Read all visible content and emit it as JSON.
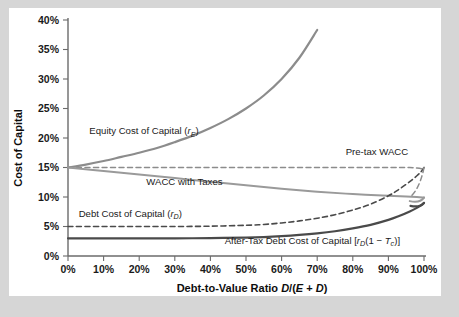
{
  "figure": {
    "background_color": "#d6d6d6",
    "panel_color": "#ffffff"
  },
  "chart_data": {
    "type": "line",
    "title": "",
    "xlabel": "Debt-to-Value Ratio D/(E + D)",
    "ylabel": "Cost of Capital",
    "xlim": [
      0,
      100
    ],
    "ylim": [
      0,
      40
    ],
    "grid": false,
    "legend_position": "inline-annotations",
    "x_tick_labels": [
      "0%",
      "10%",
      "20%",
      "30%",
      "40%",
      "50%",
      "60%",
      "70%",
      "80%",
      "90%",
      "100%"
    ],
    "x_tick_values": [
      0,
      10,
      20,
      30,
      40,
      50,
      60,
      70,
      80,
      90,
      100
    ],
    "y_tick_labels": [
      "0%",
      "5%",
      "10%",
      "15%",
      "20%",
      "25%",
      "30%",
      "35%",
      "40%"
    ],
    "y_tick_values": [
      0,
      5,
      10,
      15,
      20,
      25,
      30,
      35,
      40
    ],
    "x_units": "percent",
    "y_units": "percent",
    "series": [
      {
        "name": "Equity Cost of Capital (rE)",
        "label": "Equity Cost of Capital (",
        "label_math_base": "r",
        "label_math_sub": "E",
        "label_math_tail": ")",
        "style": "solid",
        "color": "#8c8c8c",
        "width": 2.2,
        "x": [
          0,
          5,
          10,
          15,
          20,
          25,
          30,
          35,
          40,
          45,
          50,
          55,
          60,
          65,
          70,
          75,
          80,
          85
        ],
        "values": [
          15.0,
          15.5,
          16.1,
          16.8,
          17.5,
          18.3,
          19.3,
          20.4,
          21.7,
          23.2,
          25.0,
          27.2,
          30.0,
          33.6,
          38.3,
          45.0,
          55.0,
          72.0
        ],
        "note": "rE = rU + (D/E)(rU - rD); rU=15%, rD rises with leverage"
      },
      {
        "name": "Pre-tax WACC",
        "label": "Pre-tax WACC",
        "style": "dashed",
        "color": "#8c8c8c",
        "width": 1.5,
        "x": [
          0,
          10,
          20,
          30,
          40,
          50,
          60,
          70,
          80,
          88,
          93,
          96,
          98,
          99.3,
          100
        ],
        "values": [
          15.0,
          15.0,
          15.0,
          15.0,
          15.0,
          15.0,
          15.0,
          15.0,
          15.0,
          15.0,
          15.0,
          15.0,
          14.9,
          14.8,
          14.7
        ],
        "note": "constant at 15% (unlevered cost of capital), curls at far right"
      },
      {
        "name": "WACC with Taxes",
        "label": "WACC with Taxes",
        "style": "solid",
        "color": "#9a9a9a",
        "width": 2.0,
        "x": [
          0,
          10,
          20,
          30,
          40,
          50,
          60,
          70,
          80,
          90,
          95,
          98,
          100
        ],
        "values": [
          15.0,
          14.4,
          13.8,
          13.2,
          12.6,
          12.0,
          11.4,
          10.9,
          10.5,
          10.2,
          10.1,
          10.0,
          9.9
        ],
        "note": "declines from 15% toward ~10% as debt tax shield grows"
      },
      {
        "name": "Debt Cost of Capital (rD)",
        "label": "Debt Cost of Capital (",
        "label_math_base": "r",
        "label_math_sub": "D",
        "label_math_tail": ")",
        "style": "dashed",
        "color": "#4a4a4a",
        "width": 1.6,
        "x": [
          0,
          10,
          20,
          30,
          40,
          50,
          55,
          60,
          65,
          70,
          75,
          80,
          85,
          90,
          93,
          96,
          98,
          99.2,
          100
        ],
        "values": [
          5.0,
          5.0,
          5.0,
          5.0,
          5.05,
          5.2,
          5.35,
          5.6,
          5.95,
          6.4,
          7.0,
          7.8,
          8.8,
          10.2,
          11.3,
          12.6,
          13.6,
          14.3,
          15.0
        ],
        "note": "flat at 5% then rises to meet 15% at D/(E+D)=100%"
      },
      {
        "name": "After-Tax Debt Cost of Capital [rD(1 - Tc)]",
        "label_prefix": "After-Tax Debt Cost of Capital [",
        "label_math_base": "r",
        "label_math_sub": "D",
        "label_math_mid": "(1 ",
        "label_math_minus": "−",
        "label_math_t": " T",
        "label_math_tsub": "c",
        "label_math_tail": ")]",
        "style": "solid",
        "color": "#4a4a4a",
        "width": 2.2,
        "x": [
          0,
          10,
          20,
          30,
          40,
          50,
          55,
          60,
          65,
          70,
          75,
          80,
          85,
          90,
          93,
          96,
          98,
          99.2,
          100
        ],
        "values": [
          3.0,
          3.0,
          3.0,
          3.0,
          3.03,
          3.12,
          3.21,
          3.36,
          3.57,
          3.84,
          4.2,
          4.68,
          5.28,
          6.12,
          6.78,
          7.56,
          8.16,
          8.58,
          9.0
        ],
        "note": "rD(1-Tc) with Tc = 40%"
      }
    ],
    "annotations": [
      {
        "name": "equity-label",
        "text": "Equity Cost of Capital (rE)",
        "x": 6,
        "y": 20.6
      },
      {
        "name": "pretax-wacc-label",
        "text": "Pre-tax WACC",
        "x": 78,
        "y": 17.2
      },
      {
        "name": "wacc-taxes-label",
        "text": "WACC with Taxes",
        "x": 22,
        "y": 12.1
      },
      {
        "name": "debt-label",
        "text": "Debt Cost of Capital (rD)",
        "x": 3,
        "y": 6.6
      },
      {
        "name": "aftertax-debt-label",
        "text": "After-Tax Debt Cost of Capital [rD(1 - Tc)]",
        "x": 44,
        "y": 2.0
      }
    ]
  },
  "axes": {
    "y_title": "Cost of Capital",
    "x_title_bold": "Debt-to-Value Ratio ",
    "x_title_math_d": "D",
    "x_title_math_slash": "/(",
    "x_title_math_e": "E",
    "x_title_math_plus": " + ",
    "x_title_math_d2": "D",
    "x_title_math_close": ")"
  }
}
